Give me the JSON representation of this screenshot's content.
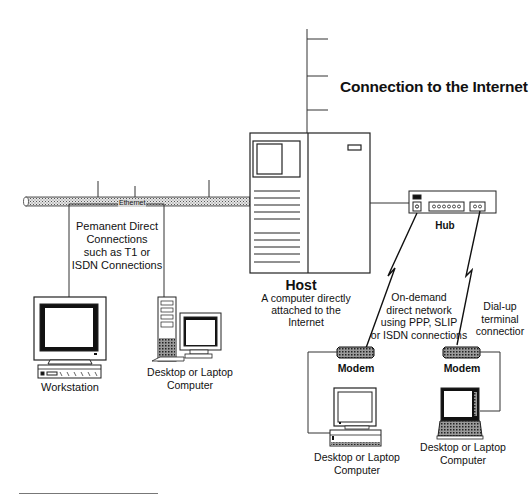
{
  "title": "Connection to the Internet",
  "ethernet": {
    "label": "Ethernet"
  },
  "permanent_connections": {
    "lines": [
      "Pemanent Direct",
      "Connections",
      "such as T1 or",
      "ISDN Connections"
    ]
  },
  "host": {
    "name": "Host",
    "description_lines": [
      "A computer directly",
      "attached to the",
      "Internet"
    ]
  },
  "hub": {
    "label": "Hub",
    "ports": [
      "o",
      "oooooo",
      "oo"
    ]
  },
  "on_demand": {
    "lines": [
      "On-demand",
      "direct  network",
      "using PPP, SLIP",
      "or ISDN connections"
    ]
  },
  "dial_up": {
    "lines": [
      "Dial-up",
      "terminal",
      "connectior"
    ]
  },
  "devices": {
    "workstation": {
      "label": "Workstation"
    },
    "desktop_left": {
      "lines": [
        "Desktop or Laptop",
        "Computer"
      ]
    },
    "modem_left": {
      "label": "Modem"
    },
    "modem_right": {
      "label": "Modem"
    },
    "desktop_bottom": {
      "lines": [
        "Desktop or Laptop",
        "Computer"
      ]
    },
    "laptop_bottom": {
      "lines": [
        "Desktop or Laptop",
        "Computer"
      ]
    }
  },
  "colors": {
    "line": "#222222",
    "cable_fill": "#cfcfcf",
    "screen_dark": "#111111"
  }
}
